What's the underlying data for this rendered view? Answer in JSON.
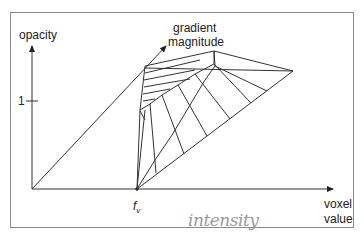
{
  "diagram": {
    "axes": {
      "y_label": "opacity",
      "x_label_line1": "voxel",
      "x_label_line2": "value",
      "z_label_line1": "gradient",
      "z_label_line2": "magnitude"
    },
    "ticks": {
      "y_tick_one": "1",
      "x_tick_fv": "f",
      "x_tick_fv_sub": "v"
    },
    "annotation": {
      "handwritten": "intensity"
    },
    "colors": {
      "line": "#333333",
      "frame": "#8a8a8a",
      "handwriting": "#9a9a9a"
    }
  }
}
